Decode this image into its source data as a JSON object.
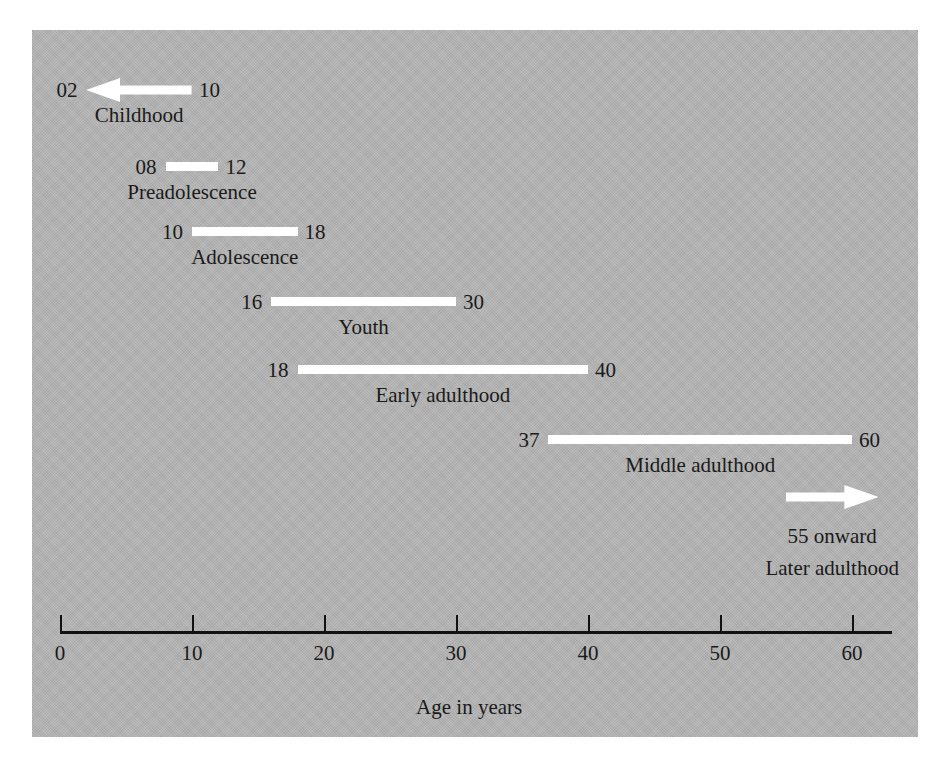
{
  "chart_data": {
    "type": "bar",
    "orientation": "horizontal",
    "title": "",
    "xlabel": "Age in years",
    "ylabel": "",
    "xlim": [
      0,
      63
    ],
    "grid": false,
    "legend": false,
    "categories": [
      "Childhood",
      "Preadolescence",
      "Adolescence",
      "Youth",
      "Early adulthood",
      "Middle adulthood",
      "Later adulthood"
    ],
    "x_ticks": [
      0,
      10,
      20,
      30,
      40,
      50,
      60
    ],
    "x_tick_labels": [
      "0",
      "10",
      "20",
      "30",
      "40",
      "50",
      "60"
    ],
    "bar_color": "#ffffff",
    "panel_color": "#b4b4b4",
    "text_color": "#1a1a1a",
    "axis_color": "#111111",
    "stages": [
      {
        "name": "Childhood",
        "start": 2,
        "end": 10,
        "start_label": "02",
        "end_label": "10",
        "marker": "arrow-left",
        "note": ""
      },
      {
        "name": "Preadolescence",
        "start": 8,
        "end": 12,
        "start_label": "08",
        "end_label": "12",
        "marker": "bar",
        "note": ""
      },
      {
        "name": "Adolescence",
        "start": 10,
        "end": 18,
        "start_label": "10",
        "end_label": "18",
        "marker": "bar",
        "note": ""
      },
      {
        "name": "Youth",
        "start": 16,
        "end": 30,
        "start_label": "16",
        "end_label": "30",
        "marker": "bar",
        "note": ""
      },
      {
        "name": "Early adulthood",
        "start": 18,
        "end": 40,
        "start_label": "18",
        "end_label": "40",
        "marker": "bar",
        "note": ""
      },
      {
        "name": "Middle adulthood",
        "start": 37,
        "end": 60,
        "start_label": "37",
        "end_label": "60",
        "marker": "bar",
        "note": ""
      },
      {
        "name": "Later adulthood",
        "start": 55,
        "end": 62,
        "start_label": "",
        "end_label": "",
        "marker": "arrow-right",
        "note": "55 onward"
      }
    ]
  }
}
